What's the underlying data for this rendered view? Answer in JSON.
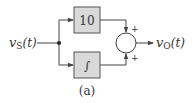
{
  "diagram": {
    "input_label": "v",
    "input_sub": "S",
    "input_arg": "(t)",
    "output_label": "v",
    "output_sub": "O",
    "output_arg": "(t)",
    "gain_block": "10",
    "integrator_block": "∫",
    "sum_sign_top": "+",
    "sum_sign_bottom": "+",
    "caption": "(a)",
    "colors": {
      "block_fill": "#d9d9d9",
      "line": "#444444"
    }
  }
}
